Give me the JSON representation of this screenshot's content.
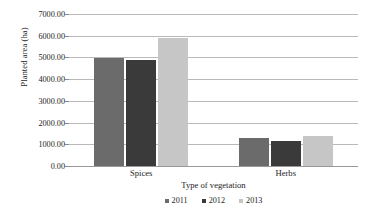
{
  "chart_data": {
    "type": "bar",
    "title": "",
    "xlabel": "Type of vegetation",
    "ylabel": "Planted area (ha)",
    "categories": [
      "Spices",
      "Herbs"
    ],
    "series": [
      {
        "name": "2011",
        "color": "#6b6b6b",
        "values": [
          4970,
          1280
        ]
      },
      {
        "name": "2012",
        "color": "#3a3a3a",
        "values": [
          4900,
          1130
        ]
      },
      {
        "name": "2013",
        "color": "#c6c6c6",
        "values": [
          5880,
          1400
        ]
      }
    ],
    "ylim": [
      0,
      7000
    ],
    "ytick_step": 1000,
    "ytick_labels": [
      "7000.00",
      "6000.00",
      "5000.00",
      "4000.00",
      "3000.00",
      "2000.00",
      "1000.00",
      "0.00"
    ],
    "ytick_values": [
      7000,
      6000,
      5000,
      4000,
      3000,
      2000,
      1000,
      0
    ],
    "grid": true,
    "legend_position": "bottom",
    "plot_background": "#ffffff",
    "gridline_color": "#b9b9b9"
  }
}
